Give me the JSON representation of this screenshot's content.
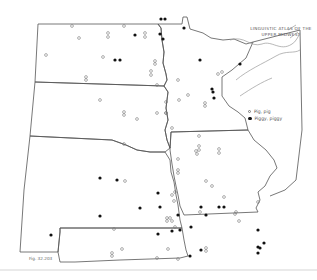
{
  "title": {
    "line1": "LINGUISTIC ATLAS OF THE",
    "line2": "UPPER MIDWEST"
  },
  "legend": {
    "items": [
      {
        "symbol": "open-circle",
        "label": "Pig, pig"
      },
      {
        "symbol": "filled-circle",
        "label": "Piggy, piggy"
      }
    ]
  },
  "figure_label": "Fig. 32.203",
  "colors": {
    "boundary": "#555555",
    "coast": "#999999",
    "open_marker": "#777777",
    "filled_marker": "#111111",
    "background": "#ffffff"
  },
  "open_points": [
    [
      72,
      26
    ],
    [
      124,
      26
    ],
    [
      108,
      33
    ],
    [
      108,
      37
    ],
    [
      145,
      33
    ],
    [
      145,
      37
    ],
    [
      79,
      38
    ],
    [
      46,
      55
    ],
    [
      103,
      57
    ],
    [
      86,
      77
    ],
    [
      86,
      80
    ],
    [
      151,
      71
    ],
    [
      151,
      75
    ],
    [
      155,
      61
    ],
    [
      155,
      64
    ],
    [
      157,
      85
    ],
    [
      100,
      100
    ],
    [
      124,
      112
    ],
    [
      124,
      115
    ],
    [
      166,
      113
    ],
    [
      157,
      113
    ],
    [
      137,
      119
    ],
    [
      166,
      113
    ],
    [
      178,
      80
    ],
    [
      222,
      72
    ],
    [
      188,
      95
    ],
    [
      205,
      103
    ],
    [
      205,
      106
    ],
    [
      166,
      102
    ],
    [
      179,
      100
    ],
    [
      218,
      74
    ],
    [
      172,
      128
    ],
    [
      199,
      136
    ],
    [
      196,
      151
    ],
    [
      197,
      154
    ],
    [
      219,
      153
    ],
    [
      199,
      146
    ],
    [
      199,
      150
    ],
    [
      178,
      159
    ],
    [
      219,
      149
    ],
    [
      178,
      170
    ],
    [
      178,
      173
    ],
    [
      206,
      181
    ],
    [
      212,
      186
    ],
    [
      224,
      197
    ],
    [
      174,
      201
    ],
    [
      175,
      192
    ],
    [
      172,
      195
    ],
    [
      258,
      202
    ],
    [
      170,
      218
    ],
    [
      172,
      221
    ],
    [
      235,
      214
    ],
    [
      236,
      212
    ],
    [
      200,
      212
    ],
    [
      239,
      221
    ],
    [
      125,
      181
    ],
    [
      124,
      144
    ],
    [
      167,
      221
    ],
    [
      167,
      218
    ],
    [
      175,
      227
    ],
    [
      206,
      248
    ],
    [
      206,
      251
    ],
    [
      178,
      259
    ],
    [
      157,
      258
    ],
    [
      168,
      249
    ],
    [
      114,
      229
    ],
    [
      112,
      253
    ],
    [
      112,
      256
    ],
    [
      122,
      249
    ]
  ],
  "filled_points": [
    [
      135,
      35
    ],
    [
      115,
      60
    ],
    [
      120,
      60
    ],
    [
      160,
      34
    ],
    [
      200,
      60
    ],
    [
      240,
      64
    ],
    [
      163,
      39
    ],
    [
      161,
      19
    ],
    [
      165,
      19
    ],
    [
      184,
      28
    ],
    [
      212,
      89
    ],
    [
      213,
      92
    ],
    [
      214,
      98
    ],
    [
      100,
      178
    ],
    [
      117,
      180
    ],
    [
      158,
      193
    ],
    [
      140,
      208
    ],
    [
      160,
      207
    ],
    [
      51,
      235
    ],
    [
      100,
      216
    ],
    [
      158,
      234
    ],
    [
      178,
      215
    ],
    [
      201,
      207
    ],
    [
      180,
      230
    ],
    [
      190,
      256
    ],
    [
      201,
      250
    ],
    [
      224,
      207
    ],
    [
      206,
      215
    ],
    [
      219,
      207
    ],
    [
      258,
      230
    ],
    [
      264,
      243
    ],
    [
      258,
      253
    ],
    [
      258,
      247
    ],
    [
      260,
      248
    ],
    [
      191,
      227
    ],
    [
      172,
      231
    ]
  ]
}
